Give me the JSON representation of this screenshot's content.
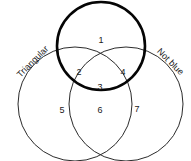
{
  "diagram": {
    "type": "venn-3-set",
    "title": "",
    "background_color": "#ffffff",
    "stroke_color": "#2b2b2b",
    "emphasis_stroke_color": "#050505",
    "sets": [
      {
        "id": "top",
        "label": "",
        "emphasized": true,
        "cx": 101,
        "cy": 46,
        "r": 44
      },
      {
        "id": "left",
        "label": "Triangular",
        "emphasized": false,
        "cx": 75,
        "cy": 104,
        "r": 57,
        "label_x": 33,
        "label_y": 62,
        "label_rotation": -45
      },
      {
        "id": "right",
        "label": "Not blue",
        "emphasized": false,
        "cx": 126,
        "cy": 104,
        "r": 57,
        "label_x": 170,
        "label_y": 62,
        "label_rotation": 45
      }
    ],
    "regions": [
      {
        "id": "top-only",
        "number": "1",
        "x": 101,
        "y": 41
      },
      {
        "id": "top-left",
        "number": "2",
        "x": 79,
        "y": 73
      },
      {
        "id": "all-three",
        "number": "3",
        "x": 100,
        "y": 88
      },
      {
        "id": "top-right",
        "number": "4",
        "x": 123,
        "y": 73
      },
      {
        "id": "left-only",
        "number": "5",
        "x": 62,
        "y": 111
      },
      {
        "id": "left-right",
        "number": "6",
        "x": 100,
        "y": 111
      },
      {
        "id": "right-only",
        "number": "7",
        "x": 137,
        "y": 110
      }
    ]
  }
}
